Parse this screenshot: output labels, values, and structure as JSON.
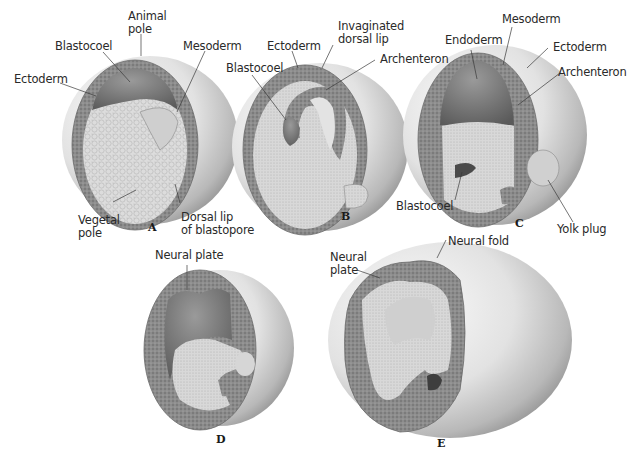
{
  "figure": {
    "panels": [
      {
        "id": "A",
        "letter": "A",
        "labels": {
          "animal_pole": "Animal\npole",
          "blastocoel": "Blastocoel",
          "mesoderm": "Mesoderm",
          "ectoderm": "Ectoderm",
          "vegetal_pole": "Vegetal\npole",
          "dorsal_lip": "Dorsal lip\nof blastopore"
        }
      },
      {
        "id": "B",
        "letter": "B",
        "labels": {
          "ectoderm": "Ectoderm",
          "invaginated_dorsal_lip": "Invaginated\ndorsal lip",
          "blastocoel": "Blastocoel",
          "archenteron": "Archenteron"
        }
      },
      {
        "id": "C",
        "letter": "C",
        "labels": {
          "mesoderm": "Mesoderm",
          "endoderm": "Endoderm",
          "ectoderm": "Ectoderm",
          "archenteron": "Archenteron",
          "blastocoel": "Blastocoel",
          "yolk_plug": "Yolk plug"
        }
      },
      {
        "id": "D",
        "letter": "D",
        "labels": {
          "neural_plate": "Neural plate"
        }
      },
      {
        "id": "E",
        "letter": "E",
        "labels": {
          "neural_plate": "Neural\nplate",
          "neural_fold": "Neural fold"
        }
      }
    ],
    "colors": {
      "background": "#ffffff",
      "label_text": "#2a2a2a",
      "leader_line": "#3a3a3a",
      "outer_shell_light": "#f2f2f2",
      "outer_shell_dark": "#9a9a9a",
      "ectoderm_layer": "#8a8a8a",
      "yolk_cells": "#d6d6d6",
      "cavity": "#6e6e6e"
    }
  }
}
